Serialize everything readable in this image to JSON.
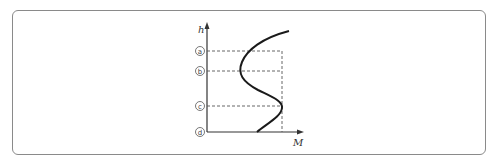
{
  "diagram": {
    "axes": {
      "y_label": "h",
      "x_label": "M"
    },
    "levels": [
      {
        "id": "a",
        "label": "a",
        "y": 51
      },
      {
        "id": "b",
        "label": "b",
        "y": 71
      },
      {
        "id": "c",
        "label": "c",
        "y": 106
      },
      {
        "id": "d",
        "label": "d",
        "y": 132
      }
    ],
    "colors": {
      "frame": "#8a8a8a",
      "curve": "#1a1a1a",
      "axis": "#333333",
      "dashed": "#555555"
    }
  }
}
